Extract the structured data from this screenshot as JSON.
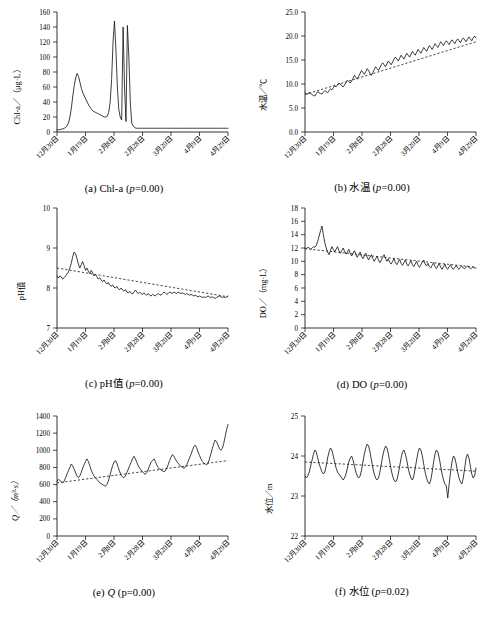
{
  "figure": {
    "panels": [
      {
        "id": "a",
        "caption_prefix": "(a) Chl-a (",
        "caption_italic": "p",
        "caption_suffix": "=0.00)",
        "ylabel": "Chl-a／（μg·L）",
        "yticks": [
          "0",
          "20",
          "40",
          "60",
          "80",
          "100",
          "120",
          "140",
          "160"
        ],
        "xticks": [
          "12月30日",
          "1月19日",
          "2月8日",
          "2月28日",
          "3月20日",
          "4月9日",
          "4月29日"
        ]
      },
      {
        "id": "b",
        "caption_prefix": "(b) 水温 (",
        "caption_italic": "p",
        "caption_suffix": "=0.00)",
        "ylabel": "水温／℃",
        "yticks": [
          "0.0",
          "5.0",
          "10.0",
          "15.0",
          "20.0",
          "25.0"
        ],
        "xticks": [
          "12月30日",
          "1月19日",
          "2月8日",
          "2月28日",
          "3月20日",
          "4月9日",
          "4月29日"
        ]
      },
      {
        "id": "c",
        "caption_prefix": "(c) pH值 (",
        "caption_italic": "p",
        "caption_suffix": "=0.00)",
        "ylabel": "pH值",
        "yticks": [
          "7",
          "8",
          "9",
          "10"
        ],
        "xticks": [
          "12月30日",
          "1月19日",
          "2月8日",
          "2月28日",
          "3月20日",
          "4月9日",
          "4月29日"
        ]
      },
      {
        "id": "d",
        "caption_prefix": "(d) DO (",
        "caption_italic": "p",
        "caption_suffix": "=0.00)",
        "ylabel": "DO／（mg·L）",
        "yticks": [
          "0",
          "2",
          "4",
          "6",
          "8",
          "10",
          "12",
          "14",
          "16",
          "18"
        ],
        "xticks": [
          "12月30日",
          "1月19日",
          "2月8日",
          "2月28日",
          "3月20日",
          "4月9日",
          "4月29日"
        ]
      },
      {
        "id": "e",
        "caption_prefix": "(e) ",
        "caption_italic": "Q",
        "caption_suffix": " (p=0.00)",
        "ylabel": "Q／（m³·s）",
        "yticks": [
          "0",
          "200",
          "400",
          "600",
          "800",
          "1000",
          "1200",
          "1400"
        ],
        "xticks": [
          "12月30日",
          "1月19日",
          "2月8日",
          "2月28日",
          "3月20日",
          "4月9日",
          "4月29日"
        ]
      },
      {
        "id": "f",
        "caption_prefix": "(f) 水位 (",
        "caption_italic": "p",
        "caption_suffix": "=0.02)",
        "ylabel": "水位／m",
        "yticks": [
          "22",
          "23",
          "24",
          "25"
        ],
        "xticks": [
          "12月30日",
          "1月19日",
          "2月8日",
          "2月28日",
          "3月20日",
          "4月9日",
          "4月29日"
        ]
      }
    ]
  },
  "chart_data": [
    {
      "type": "line",
      "id": "a",
      "title": "(a) Chl-a (p=0.00)",
      "xlabel": "",
      "ylabel": "Chl-a/(μg·L)",
      "ylim": [
        0,
        160
      ],
      "yticks": [
        0,
        20,
        40,
        60,
        80,
        100,
        120,
        140,
        160
      ],
      "xtick_labels": [
        "12月30日",
        "1月19日",
        "2月8日",
        "2月28日",
        "3月20日",
        "4月9日",
        "4月29日"
      ],
      "grid": false,
      "legend": null,
      "trendline": false,
      "values": [
        3,
        3,
        3,
        4,
        4,
        5,
        6,
        8,
        12,
        20,
        32,
        48,
        62,
        72,
        78,
        74,
        66,
        58,
        52,
        48,
        44,
        40,
        36,
        33,
        30,
        28,
        27,
        26,
        25,
        24,
        23,
        22,
        21,
        20,
        20,
        21,
        26,
        40,
        70,
        120,
        148,
        110,
        60,
        30,
        20,
        16,
        140,
        60,
        14,
        142,
        100,
        40,
        12,
        8,
        6,
        5,
        5,
        5,
        5,
        5,
        5,
        5,
        5,
        5,
        5,
        5,
        5,
        5,
        5,
        5,
        5,
        5,
        5,
        5,
        5,
        5,
        5,
        5,
        5,
        5,
        5,
        5,
        5,
        5,
        5,
        5,
        5,
        5,
        5,
        5,
        5,
        5,
        5,
        5,
        5,
        5,
        5,
        5,
        5,
        5,
        5,
        5,
        5,
        5,
        5,
        5,
        5,
        5,
        5,
        5,
        5,
        5,
        5,
        5,
        5,
        5,
        5,
        5,
        5,
        5
      ]
    },
    {
      "type": "line",
      "id": "b",
      "title": "(b) 水温 (p=0.00)",
      "xlabel": "",
      "ylabel": "水温/℃",
      "ylim": [
        0,
        25
      ],
      "yticks": [
        0.0,
        5.0,
        10.0,
        15.0,
        20.0,
        25.0
      ],
      "xtick_labels": [
        "12月30日",
        "1月19日",
        "2月8日",
        "2月28日",
        "3月20日",
        "4月9日",
        "4月29日"
      ],
      "grid": false,
      "legend": null,
      "trendline": true,
      "trend_start": 7.8,
      "trend_end": 18.8,
      "values": [
        8.2,
        8.0,
        7.9,
        8.3,
        8.0,
        7.8,
        7.6,
        7.5,
        8.0,
        8.4,
        8.2,
        8.0,
        7.9,
        8.3,
        8.6,
        8.4,
        8.2,
        8.6,
        9.0,
        8.8,
        9.2,
        9.6,
        9.4,
        9.8,
        10.2,
        10.0,
        9.6,
        9.4,
        9.8,
        10.4,
        10.8,
        10.5,
        10.2,
        10.6,
        11.2,
        11.8,
        11.4,
        11.0,
        11.6,
        12.2,
        12.8,
        12.4,
        12.0,
        12.6,
        13.2,
        12.8,
        12.2,
        11.8,
        12.4,
        13.0,
        13.6,
        13.2,
        12.8,
        13.4,
        14.0,
        14.4,
        14.0,
        13.6,
        14.2,
        14.8,
        14.4,
        14.0,
        14.6,
        15.2,
        15.6,
        15.2,
        14.8,
        15.4,
        16.0,
        15.6,
        15.2,
        15.8,
        16.4,
        16.0,
        15.6,
        16.2,
        16.8,
        16.4,
        16.0,
        16.6,
        17.2,
        16.8,
        16.4,
        17.0,
        17.6,
        17.2,
        16.8,
        17.4,
        18.0,
        17.6,
        17.2,
        17.8,
        18.4,
        18.0,
        17.6,
        18.2,
        18.8,
        18.4,
        18.0,
        18.6,
        19.0,
        18.6,
        18.2,
        18.8,
        19.2,
        18.8,
        18.4,
        19.0,
        19.4,
        19.0,
        18.6,
        19.2,
        19.6,
        19.2,
        18.8,
        19.4,
        19.8,
        19.4,
        19.0,
        19.6,
        20.0,
        19.6
      ]
    },
    {
      "type": "line",
      "id": "c",
      "title": "(c) pH值 (p=0.00)",
      "xlabel": "",
      "ylabel": "pH值",
      "ylim": [
        7,
        10
      ],
      "yticks": [
        7,
        8,
        9,
        10
      ],
      "xtick_labels": [
        "12月30日",
        "1月19日",
        "2月8日",
        "2月28日",
        "3月20日",
        "4月9日",
        "4月29日"
      ],
      "grid": false,
      "legend": null,
      "trendline": true,
      "trend_start": 8.5,
      "trend_end": 7.78,
      "values": [
        8.3,
        8.25,
        8.3,
        8.28,
        8.22,
        8.26,
        8.3,
        8.35,
        8.4,
        8.5,
        8.62,
        8.78,
        8.9,
        8.86,
        8.74,
        8.6,
        8.5,
        8.58,
        8.66,
        8.56,
        8.44,
        8.5,
        8.42,
        8.36,
        8.44,
        8.38,
        8.3,
        8.34,
        8.28,
        8.22,
        8.26,
        8.2,
        8.16,
        8.2,
        8.14,
        8.1,
        8.14,
        8.08,
        8.04,
        8.08,
        8.02,
        8.0,
        8.04,
        7.98,
        7.96,
        8.0,
        7.95,
        7.92,
        7.96,
        7.9,
        7.88,
        7.92,
        7.87,
        7.85,
        7.9,
        7.95,
        7.9,
        7.86,
        7.9,
        7.86,
        7.84,
        7.88,
        7.84,
        7.82,
        7.86,
        7.82,
        7.8,
        7.84,
        7.82,
        7.8,
        7.84,
        7.86,
        7.84,
        7.82,
        7.86,
        7.9,
        7.88,
        7.84,
        7.86,
        7.9,
        7.88,
        7.86,
        7.9,
        7.88,
        7.86,
        7.9,
        7.88,
        7.86,
        7.88,
        7.86,
        7.84,
        7.86,
        7.84,
        7.82,
        7.84,
        7.82,
        7.8,
        7.82,
        7.8,
        7.78,
        7.8,
        7.78,
        7.76,
        7.78,
        7.76,
        7.78,
        7.8,
        7.78,
        7.76,
        7.78,
        7.76,
        7.74,
        7.76,
        7.78,
        7.8,
        7.78,
        7.76,
        7.78,
        7.76,
        7.78,
        7.8
      ]
    },
    {
      "type": "line",
      "id": "d",
      "title": "(d) DO (p=0.00)",
      "xlabel": "",
      "ylabel": "DO/(mg·L)",
      "ylim": [
        0,
        18
      ],
      "yticks": [
        0,
        2,
        4,
        6,
        8,
        10,
        12,
        14,
        16,
        18
      ],
      "xtick_labels": [
        "12月30日",
        "1月19日",
        "2月8日",
        "2月28日",
        "3月20日",
        "4月9日",
        "4月29日"
      ],
      "grid": false,
      "legend": null,
      "trendline": true,
      "trend_start": 11.9,
      "trend_end": 9.1,
      "values": [
        12.0,
        11.9,
        12.1,
        12.0,
        11.8,
        12.0,
        12.2,
        12.1,
        12.4,
        13.0,
        13.8,
        14.6,
        15.3,
        14.0,
        12.8,
        12.0,
        11.4,
        11.0,
        11.6,
        12.2,
        11.8,
        11.4,
        11.8,
        12.2,
        11.6,
        11.2,
        11.6,
        12.0,
        11.5,
        11.1,
        11.4,
        11.8,
        11.2,
        10.8,
        11.2,
        11.6,
        11.0,
        10.6,
        11.0,
        11.4,
        10.8,
        10.4,
        10.8,
        11.2,
        10.6,
        10.2,
        10.6,
        11.0,
        10.4,
        10.0,
        10.4,
        10.8,
        10.2,
        9.8,
        10.2,
        10.6,
        11.0,
        10.4,
        10.0,
        10.4,
        9.8,
        9.6,
        10.0,
        10.4,
        9.8,
        9.5,
        9.9,
        10.3,
        9.7,
        9.4,
        9.8,
        10.2,
        9.6,
        9.3,
        9.7,
        10.1,
        9.5,
        9.2,
        9.6,
        10.0,
        9.4,
        9.1,
        9.5,
        9.9,
        10.2,
        9.6,
        9.3,
        9.7,
        9.2,
        9.0,
        9.4,
        9.8,
        9.2,
        8.9,
        9.3,
        9.7,
        9.1,
        8.8,
        9.2,
        9.6,
        9.0,
        8.8,
        9.2,
        9.5,
        9.0,
        8.8,
        9.1,
        9.4,
        9.0,
        8.8,
        9.1,
        9.3,
        9.0,
        8.9,
        9.1,
        9.3,
        9.1,
        8.9,
        9.0,
        9.2,
        9.0,
        9.0
      ]
    },
    {
      "type": "line",
      "id": "e",
      "title": "(e) Q (p=0.00)",
      "xlabel": "",
      "ylabel": "Q/(m³·s)",
      "ylim": [
        0,
        1400
      ],
      "yticks": [
        0,
        200,
        400,
        600,
        800,
        1000,
        1200,
        1400
      ],
      "xtick_labels": [
        "12月30日",
        "1月19日",
        "2月8日",
        "2月28日",
        "3月20日",
        "4月9日",
        "4月29日"
      ],
      "grid": false,
      "legend": null,
      "trendline": true,
      "trend_start": 620,
      "trend_end": 880,
      "values": [
        640,
        660,
        650,
        630,
        620,
        640,
        680,
        720,
        760,
        800,
        840,
        820,
        780,
        740,
        700,
        680,
        700,
        740,
        790,
        830,
        870,
        900,
        870,
        820,
        770,
        730,
        700,
        680,
        660,
        640,
        620,
        610,
        600,
        590,
        580,
        600,
        640,
        700,
        760,
        820,
        860,
        880,
        850,
        800,
        750,
        710,
        690,
        680,
        700,
        740,
        780,
        820,
        860,
        900,
        930,
        900,
        860,
        820,
        790,
        770,
        750,
        730,
        720,
        740,
        780,
        820,
        860,
        880,
        900,
        870,
        830,
        800,
        780,
        770,
        760,
        750,
        760,
        790,
        830,
        880,
        920,
        950,
        930,
        900,
        870,
        850,
        830,
        810,
        800,
        790,
        800,
        830,
        870,
        910,
        950,
        1000,
        1040,
        1060,
        1030,
        980,
        940,
        900,
        870,
        850,
        840,
        830,
        850,
        900,
        960,
        1020,
        1080,
        1120,
        1100,
        1060,
        1020,
        1000,
        1020,
        1080,
        1160,
        1240,
        1300
      ]
    },
    {
      "type": "line",
      "id": "f",
      "title": "(f) 水位 (p=0.02)",
      "xlabel": "",
      "ylabel": "水位/m",
      "ylim": [
        22,
        25
      ],
      "yticks": [
        22,
        23,
        24,
        25
      ],
      "xtick_labels": [
        "12月30日",
        "1月19日",
        "2月8日",
        "2月28日",
        "3月20日",
        "4月9日",
        "4月29日"
      ],
      "grid": false,
      "legend": null,
      "trendline": true,
      "trend_start": 23.85,
      "trend_end": 23.62,
      "values": [
        23.5,
        23.45,
        23.5,
        23.6,
        23.75,
        23.9,
        24.05,
        24.15,
        24.1,
        23.95,
        23.8,
        23.7,
        23.6,
        23.55,
        23.6,
        23.75,
        23.95,
        24.1,
        24.2,
        24.15,
        24.0,
        23.85,
        23.7,
        23.6,
        23.55,
        23.5,
        23.45,
        23.4,
        23.45,
        23.55,
        23.7,
        23.85,
        23.95,
        24.0,
        23.9,
        23.75,
        23.6,
        23.5,
        23.45,
        23.5,
        23.65,
        23.85,
        24.05,
        24.2,
        24.3,
        24.25,
        24.1,
        23.9,
        23.7,
        23.55,
        23.45,
        23.4,
        23.45,
        23.6,
        23.8,
        24.0,
        24.15,
        24.25,
        24.2,
        24.05,
        23.85,
        23.65,
        23.5,
        23.4,
        23.35,
        23.4,
        23.55,
        23.75,
        23.95,
        24.1,
        24.15,
        24.05,
        23.9,
        23.7,
        23.55,
        23.45,
        23.4,
        23.5,
        23.7,
        23.9,
        24.1,
        24.2,
        24.15,
        24.0,
        23.8,
        23.6,
        23.45,
        23.35,
        23.3,
        23.4,
        23.6,
        23.85,
        24.05,
        24.15,
        24.1,
        23.95,
        23.75,
        23.55,
        23.4,
        23.3,
        23.25,
        22.95,
        23.3,
        23.6,
        23.85,
        24.0,
        23.95,
        23.8,
        23.6,
        23.45,
        23.35,
        23.3,
        23.45,
        23.7,
        23.95,
        24.05,
        23.95,
        23.75,
        23.55,
        23.45,
        23.5,
        23.7
      ]
    }
  ]
}
